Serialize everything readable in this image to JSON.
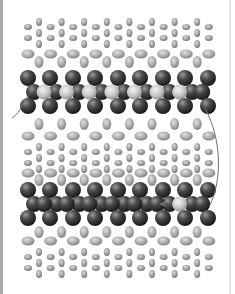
{
  "figure": {
    "colors": {
      "background": "#ffffff",
      "dark_atom": "#2a2a2a",
      "light_center_atom": "#d0d0d0",
      "ion": "#a0a0a0",
      "solvent": "#9a9a9a",
      "arrow": "#707070",
      "border": "#a8a8a8"
    },
    "layers": [
      {
        "name": "solvent-top",
        "type": "small-molecules",
        "y_range": [
          17,
          48
        ]
      },
      {
        "name": "ions-top",
        "type": "medium-ellipses",
        "y_range": [
          50,
          64
        ]
      },
      {
        "name": "sheet-1",
        "type": "dark-atom-sheet",
        "y_range": [
          70,
          120
        ],
        "highlighted_centers": 7
      },
      {
        "name": "ions-mid-1",
        "type": "medium-ellipses",
        "y_range": [
          118,
          140
        ]
      },
      {
        "name": "solvent-mid",
        "type": "small-molecules",
        "y_range": [
          140,
          170
        ]
      },
      {
        "name": "ions-mid-2",
        "type": "medium-ellipses",
        "y_range": [
          170,
          182
        ]
      },
      {
        "name": "sheet-2",
        "type": "dark-atom-sheet",
        "y_range": [
          185,
          222
        ],
        "highlighted_centers": 1
      },
      {
        "name": "ions-bottom",
        "type": "medium-ellipses",
        "y_range": [
          225,
          240
        ]
      },
      {
        "name": "solvent-bottom",
        "type": "small-molecules",
        "y_range": [
          240,
          275
        ]
      }
    ],
    "arrows": [
      {
        "name": "left-entry-arrow",
        "from": [
          12,
          118
        ],
        "to": [
          32,
          92
        ]
      },
      {
        "name": "right-path-arrow",
        "from": [
          205,
          108
        ],
        "to": [
          210,
          205
        ]
      },
      {
        "name": "sheet-2-hop-arrow",
        "from": [
          170,
          204
        ],
        "to": [
          158,
          204
        ]
      }
    ]
  }
}
